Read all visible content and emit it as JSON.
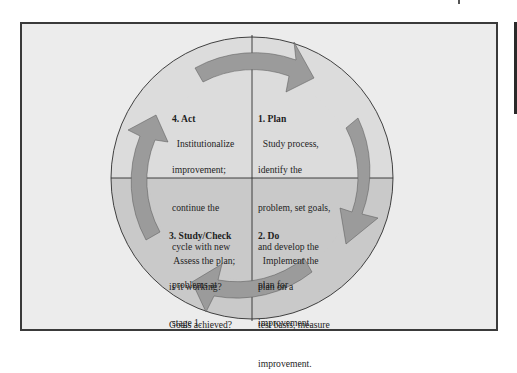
{
  "diagram": {
    "type": "cycle",
    "colors": {
      "background": "#ececec",
      "upper_half": "#dcdcdc",
      "lower_half": "#c9c9c9",
      "arrow": "#9b9b9b",
      "lines": "#2e2e2e"
    },
    "stages": [
      {
        "id": "plan",
        "title": "1. Plan",
        "lines": [
          "Study process,",
          "identify the",
          "problem, set goals,",
          "and develop the",
          "plan for",
          "improvement."
        ]
      },
      {
        "id": "do",
        "title": "2. Do",
        "lines": [
          "Implement the",
          "plan on a",
          "test basis, measure",
          "improvement."
        ]
      },
      {
        "id": "study-check",
        "title": "3. Study/Check",
        "lines": [
          "Assess the plan;",
          "is it working?",
          "Goals achieved?"
        ]
      },
      {
        "id": "act",
        "title": "4. Act",
        "lines": [
          "Institutionalize",
          "improvement;",
          "continue the",
          "cycle with new",
          "problems at",
          "stage 1."
        ]
      }
    ]
  }
}
